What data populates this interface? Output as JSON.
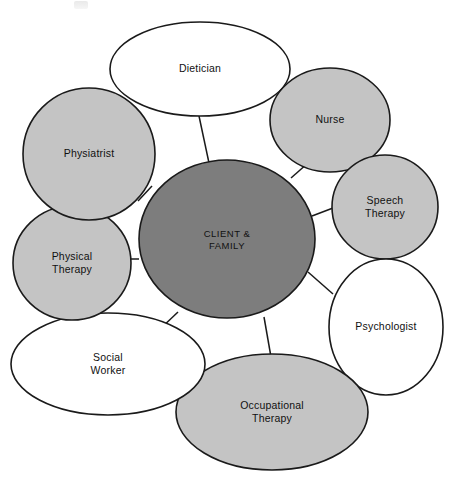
{
  "diagram": {
    "type": "hub-and-spoke",
    "colors": {
      "hub_fill": "#7d7d7d",
      "light_fill": "#c4c4c4",
      "white_fill": "#ffffff",
      "stroke": "#1a1a1a",
      "background": "#ffffff",
      "text": "#111111"
    },
    "hub": {
      "id": "client-family",
      "label_line1": "CLIENT &",
      "label_line2": "FAMILY",
      "shape": "ellipse",
      "fill": "#7d7d7d",
      "cx": 227,
      "cy": 239,
      "rx": 88,
      "ry": 79
    },
    "nodes": [
      {
        "id": "dietician",
        "label_line1": "Dietician",
        "label_line2": "",
        "shape": "ellipse",
        "fill": "#ffffff",
        "cx": 200,
        "cy": 69,
        "rx": 90,
        "ry": 47
      },
      {
        "id": "nurse",
        "label_line1": "Nurse",
        "label_line2": "",
        "shape": "circle",
        "fill": "#c4c4c4",
        "cx": 330,
        "cy": 120,
        "rx": 60,
        "ry": 52
      },
      {
        "id": "speech-therapy",
        "label_line1": "Speech",
        "label_line2": "Therapy",
        "shape": "circle",
        "fill": "#c4c4c4",
        "cx": 385,
        "cy": 207,
        "rx": 53,
        "ry": 52
      },
      {
        "id": "psychologist",
        "label_line1": "Psychologist",
        "label_line2": "",
        "shape": "ellipse",
        "fill": "#ffffff",
        "cx": 386,
        "cy": 327,
        "rx": 57,
        "ry": 68
      },
      {
        "id": "occupational-therapy",
        "label_line1": "Occupational",
        "label_line2": "Therapy",
        "shape": "ellipse",
        "fill": "#c4c4c4",
        "cx": 272,
        "cy": 412,
        "rx": 96,
        "ry": 58
      },
      {
        "id": "social-worker",
        "label_line1": "Social",
        "label_line2": "Worker",
        "shape": "ellipse",
        "fill": "#ffffff",
        "cx": 108,
        "cy": 364,
        "rx": 97,
        "ry": 51
      },
      {
        "id": "physical-therapy",
        "label_line1": "Physical",
        "label_line2": "Therapy",
        "shape": "circle",
        "fill": "#c4c4c4",
        "cx": 72,
        "cy": 263,
        "rx": 59,
        "ry": 57
      },
      {
        "id": "physiatrist",
        "label_line1": "Physiatrist",
        "label_line2": "",
        "shape": "circle",
        "fill": "#c4c4c4",
        "cx": 89,
        "cy": 154,
        "rx": 66,
        "ry": 66
      }
    ],
    "connectors": [
      {
        "id": "hub-to-dietician",
        "x1": 209,
        "y1": 163,
        "x2": 199,
        "y2": 116
      },
      {
        "id": "hub-to-nurse",
        "x1": 291,
        "y1": 178,
        "x2": 308,
        "y2": 163
      },
      {
        "id": "hub-to-speech-therapy",
        "x1": 312,
        "y1": 216,
        "x2": 333,
        "y2": 208
      },
      {
        "id": "hub-to-psychologist",
        "x1": 308,
        "y1": 272,
        "x2": 333,
        "y2": 294
      },
      {
        "id": "hub-to-occupational-therapy",
        "x1": 264,
        "y1": 317,
        "x2": 271,
        "y2": 357
      },
      {
        "id": "hub-to-social-worker",
        "x1": 178,
        "y1": 312,
        "x2": 159,
        "y2": 330
      },
      {
        "id": "hub-to-physical-therapy",
        "x1": 139,
        "y1": 259,
        "x2": 131,
        "y2": 259
      },
      {
        "id": "hub-to-physiatrist",
        "x1": 152,
        "y1": 186,
        "x2": 138,
        "y2": 201
      }
    ]
  }
}
